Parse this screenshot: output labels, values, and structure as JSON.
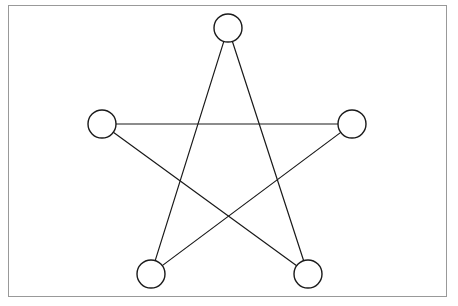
{
  "figure": {
    "title": "",
    "kind": "pentagram-node-link-diagram",
    "background_color": "#ffffff",
    "frame": {
      "name": "outer-border",
      "x": 8,
      "y": 5,
      "width": 439,
      "height": 292,
      "stroke_color": "#999999",
      "stroke_width": 1,
      "fill_color": "#ffffff"
    },
    "style": {
      "node_stroke_color": "#1a1a1a",
      "node_fill_color": "#ffffff",
      "node_stroke_width": 1.4,
      "edge_stroke_color": "#1a1a1a",
      "edge_stroke_width": 1.2,
      "node_radius": 14
    },
    "nodes": [
      {
        "id": "top",
        "label": "",
        "cx": 228,
        "cy": 28,
        "r": 14
      },
      {
        "id": "left",
        "label": "",
        "cx": 102,
        "cy": 124,
        "r": 14
      },
      {
        "id": "right",
        "label": "",
        "cx": 352,
        "cy": 124,
        "r": 14
      },
      {
        "id": "bottom-left",
        "label": "",
        "cx": 151,
        "cy": 274,
        "r": 14
      },
      {
        "id": "bottom-right",
        "label": "",
        "cx": 308,
        "cy": 274,
        "r": 14
      }
    ],
    "edges": [
      {
        "id": "edge-top-bottom-left",
        "from": "top",
        "to": "bottom-left"
      },
      {
        "id": "edge-top-bottom-right",
        "from": "top",
        "to": "bottom-right"
      },
      {
        "id": "edge-left-right",
        "from": "left",
        "to": "right"
      },
      {
        "id": "edge-left-bottom-right",
        "from": "left",
        "to": "bottom-right"
      },
      {
        "id": "edge-right-bottom-left",
        "from": "right",
        "to": "bottom-left"
      }
    ]
  }
}
